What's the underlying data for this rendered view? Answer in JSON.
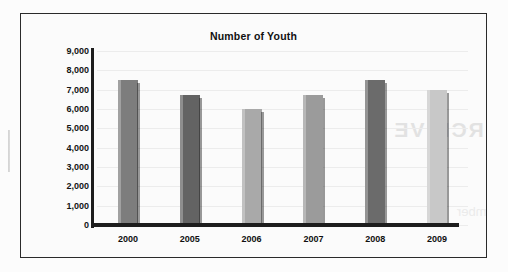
{
  "chart_data": {
    "type": "bar",
    "title": "Number of Youth",
    "xlabel": "",
    "ylabel": "",
    "categories": [
      "2000",
      "2005",
      "2006",
      "2007",
      "2008",
      "2009"
    ],
    "values": [
      7500,
      6700,
      6000,
      6700,
      7500,
      7000
    ],
    "bar_colors": [
      "#7d7d7d",
      "#636363",
      "#a9a9a9",
      "#9b9b9b",
      "#6b6b6b",
      "#c8c8c8"
    ],
    "ylim": [
      0,
      9000
    ],
    "ytick_labels": [
      "9,000",
      "8,000",
      "7,000",
      "6,000",
      "5,000",
      "4,000",
      "3,000",
      "2,000",
      "1,000",
      "0"
    ],
    "ytick_values": [
      9000,
      8000,
      7000,
      6000,
      5000,
      4000,
      3000,
      2000,
      1000,
      0
    ],
    "grid": true,
    "legend": null,
    "legend_position": "none",
    "axis_color": "#1d1d1d",
    "frame_color": "#2a2a2a",
    "background": "#fbfbfb"
  },
  "artifacts": {
    "watermark_text": "ARCHIVE",
    "watermark_text2": "number"
  }
}
